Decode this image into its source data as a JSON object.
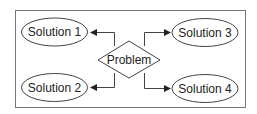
{
  "diagram": {
    "center": {
      "label": "Problem",
      "shape": "diamond"
    },
    "nodes": [
      {
        "id": "s1",
        "label": "Solution 1",
        "shape": "ellipse"
      },
      {
        "id": "s2",
        "label": "Solution 2",
        "shape": "ellipse"
      },
      {
        "id": "s3",
        "label": "Solution 3",
        "shape": "ellipse"
      },
      {
        "id": "s4",
        "label": "Solution 4",
        "shape": "ellipse"
      }
    ],
    "edges": [
      {
        "from": "Problem",
        "to": "Solution 1"
      },
      {
        "from": "Problem",
        "to": "Solution 2"
      },
      {
        "from": "Problem",
        "to": "Solution 3"
      },
      {
        "from": "Problem",
        "to": "Solution 4"
      }
    ],
    "colors": {
      "stroke": "#444444",
      "frame": "#777777",
      "background": "#ffffff"
    }
  }
}
